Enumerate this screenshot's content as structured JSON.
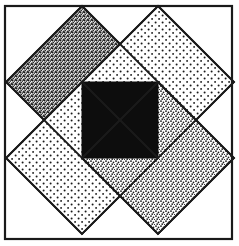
{
  "figure": {
    "canvas": {
      "width": 239,
      "height": 246,
      "background": "#ffffff"
    },
    "frame": {
      "name": "outer-frame",
      "x": 5,
      "y": 6,
      "width": 227,
      "height": 233,
      "stroke": "#1a1a1a",
      "stroke_width": 2.2,
      "fill": "none"
    },
    "center_square": {
      "name": "center-black-square",
      "x": 82,
      "y": 82,
      "width": 76,
      "height": 76,
      "fill": "#0d0d0d",
      "stroke": "#0d0d0d",
      "stroke_width": 1
    },
    "diamonds": [
      {
        "id": "diamond-top-left",
        "label": "Top-left diamond",
        "texture": "dense-stipple",
        "fill_tone": "#6e6e6e",
        "center_x": 82,
        "center_y": 82,
        "half_diagonal": 76,
        "points": "82,6 158,82 82,158 6,82",
        "stroke": "#1a1a1a",
        "stroke_width": 1.8,
        "z_order": 1
      },
      {
        "id": "diamond-top-right",
        "label": "Top-right diamond",
        "texture": "sparse-dots",
        "fill_tone": "#e9e9e9",
        "center_x": 158,
        "center_y": 82,
        "half_diagonal": 76,
        "points": "158,6 234,82 158,158 82,82",
        "stroke": "#1a1a1a",
        "stroke_width": 1.8,
        "z_order": 2
      },
      {
        "id": "diamond-bottom-left",
        "label": "Bottom-left diamond",
        "texture": "sparse-dots",
        "fill_tone": "#e9e9e9",
        "center_x": 82,
        "center_y": 158,
        "half_diagonal": 76,
        "points": "82,82 158,158 82,234 6,158",
        "stroke": "#1a1a1a",
        "stroke_width": 1.8,
        "z_order": 3
      },
      {
        "id": "diamond-bottom-right",
        "label": "Bottom-right diamond",
        "texture": "medium-stipple",
        "fill_tone": "#c4c4c4",
        "center_x": 158,
        "center_y": 158,
        "half_diagonal": 76,
        "points": "158,82 234,158 158,234 82,158",
        "stroke": "#1a1a1a",
        "stroke_width": 1.8,
        "z_order": 4
      }
    ],
    "pinwheel_overlaps": [
      {
        "id": "overlap-top-left-over-top-right",
        "label": "Top-left diamond overlaps top-right diamond",
        "points": "82,82 158,82 120,120",
        "texture": "dense-stipple"
      },
      {
        "id": "overlap-top-right-over-bottom-right",
        "label": "Top-right diamond overlaps bottom-right diamond",
        "points": "158,82 158,158 120,120",
        "texture": "sparse-dots"
      },
      {
        "id": "overlap-bottom-right-over-bottom-left",
        "label": "Bottom-right diamond overlaps bottom-left diamond",
        "points": "158,158 82,158 120,120",
        "texture": "medium-stipple"
      },
      {
        "id": "overlap-bottom-left-over-top-left",
        "label": "Bottom-left diamond overlaps top-left diamond",
        "points": "82,158 82,82 120,120",
        "texture": "sparse-dots"
      }
    ],
    "chart_data": {
      "type": "scatter",
      "title": "Pinwheel quilt block",
      "xlabel": "",
      "ylabel": "",
      "xlim": [
        0,
        239
      ],
      "ylim": [
        0,
        246
      ],
      "grid": false,
      "legend": "none",
      "series": [
        {
          "name": "Top-left diamond",
          "texture": "dense-stipple",
          "vertices": [
            [
              82,
              6
            ],
            [
              158,
              82
            ],
            [
              82,
              158
            ],
            [
              6,
              82
            ]
          ]
        },
        {
          "name": "Top-right diamond",
          "texture": "sparse-dots",
          "vertices": [
            [
              158,
              6
            ],
            [
              234,
              82
            ],
            [
              158,
              158
            ],
            [
              82,
              82
            ]
          ]
        },
        {
          "name": "Bottom-left diamond",
          "texture": "sparse-dots",
          "vertices": [
            [
              82,
              82
            ],
            [
              158,
              158
            ],
            [
              82,
              234
            ],
            [
              6,
              158
            ]
          ]
        },
        {
          "name": "Bottom-right diamond",
          "texture": "medium-stipple",
          "vertices": [
            [
              158,
              82
            ],
            [
              234,
              158
            ],
            [
              158,
              234
            ],
            [
              82,
              158
            ]
          ]
        },
        {
          "name": "Center square",
          "texture": "solid-black",
          "vertices": [
            [
              82,
              82
            ],
            [
              158,
              82
            ],
            [
              158,
              158
            ],
            [
              82,
              158
            ]
          ]
        }
      ]
    }
  }
}
